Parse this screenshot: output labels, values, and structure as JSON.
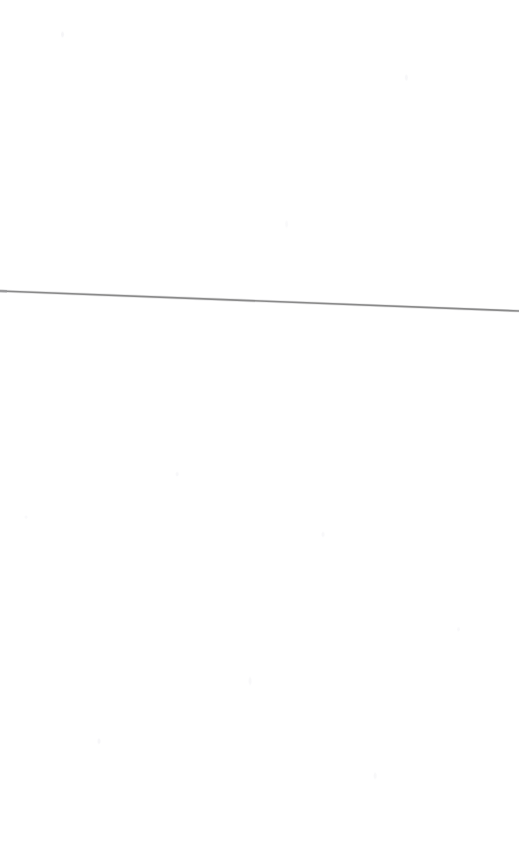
{
  "page": {
    "kind": "scanned-blank-page",
    "width": 521,
    "height": 862,
    "background_color": "#ffffff",
    "content_text": "",
    "note": ""
  },
  "rule": {
    "name": "horizontal-rule",
    "color": "#8a8a8a",
    "edge_color": "#c4c4c6",
    "stroke_width": 1.6,
    "start_x": 0,
    "start_y": 291,
    "end_x": 519,
    "end_y": 311,
    "cap_color": "#9a9a9c"
  },
  "artifacts": {
    "speckle_color": "#f0f0f4",
    "description": ""
  }
}
